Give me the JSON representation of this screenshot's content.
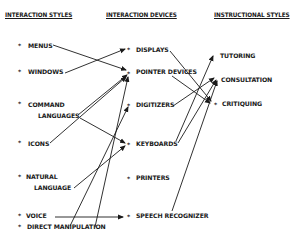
{
  "headers": {
    "styles": "INTERACTION STYLES",
    "devices": "INTERACTION DEVICES",
    "instructional": "INSTRUCTIONAL STYLES"
  },
  "bullet": "*",
  "styles": [
    {
      "id": "menus",
      "lines": [
        "MENUS"
      ]
    },
    {
      "id": "windows",
      "lines": [
        "WINDOWS"
      ]
    },
    {
      "id": "command-languages",
      "lines": [
        "COMMAND",
        "LANGUAGES"
      ]
    },
    {
      "id": "icons",
      "lines": [
        "ICONS"
      ]
    },
    {
      "id": "natural-language",
      "lines": [
        "NATURAL",
        "LANGUAGE"
      ]
    },
    {
      "id": "voice",
      "lines": [
        "VOICE"
      ]
    },
    {
      "id": "direct-manipulation",
      "lines": [
        "DIRECT MANIPULATION"
      ]
    }
  ],
  "devices": [
    {
      "id": "displays",
      "label": "DISPLAYS"
    },
    {
      "id": "pointer-devices",
      "label": "POINTER DEVICES"
    },
    {
      "id": "digitizers",
      "label": "DIGITIZERS"
    },
    {
      "id": "keyboards",
      "label": "KEYBOARDS"
    },
    {
      "id": "printers",
      "label": "PRINTERS"
    },
    {
      "id": "speech-recognizer",
      "label": "SPEECH RECOGNIZER"
    }
  ],
  "instructional": [
    {
      "id": "tutoring",
      "label": "TUTORING"
    },
    {
      "id": "consultation",
      "label": "CONSULTATION"
    },
    {
      "id": "critiquing",
      "label": "CRITIQUING"
    }
  ],
  "connections": [
    {
      "from": "MENUS",
      "to": "POINTER DEVICES"
    },
    {
      "from": "WINDOWS",
      "to": "DISPLAYS"
    },
    {
      "from": "COMMAND LANGUAGES",
      "to": "POINTER DEVICES"
    },
    {
      "from": "COMMAND LANGUAGES",
      "to": "KEYBOARDS"
    },
    {
      "from": "ICONS",
      "to": "POINTER DEVICES"
    },
    {
      "from": "NATURAL LANGUAGE",
      "to": "KEYBOARDS"
    },
    {
      "from": "VOICE",
      "to": "SPEECH RECOGNIZER"
    },
    {
      "from": "DIRECT MANIPULATION",
      "to": "POINTER DEVICES"
    },
    {
      "from": "DIRECT MANIPULATION",
      "to": "DIGITIZERS"
    },
    {
      "from": "DISPLAYS",
      "to": "CRITIQUING"
    },
    {
      "from": "POINTER DEVICES",
      "to": "CRITIQUING"
    },
    {
      "from": "DIGITIZERS",
      "to": "CONSULTATION"
    },
    {
      "from": "KEYBOARDS",
      "to": "TUTORING"
    },
    {
      "from": "KEYBOARDS",
      "to": "CONSULTATION"
    },
    {
      "from": "SPEECH RECOGNIZER",
      "to": "CONSULTATION"
    }
  ],
  "colors": {
    "ink": "#1a1a1a",
    "background": "#ffffff"
  }
}
